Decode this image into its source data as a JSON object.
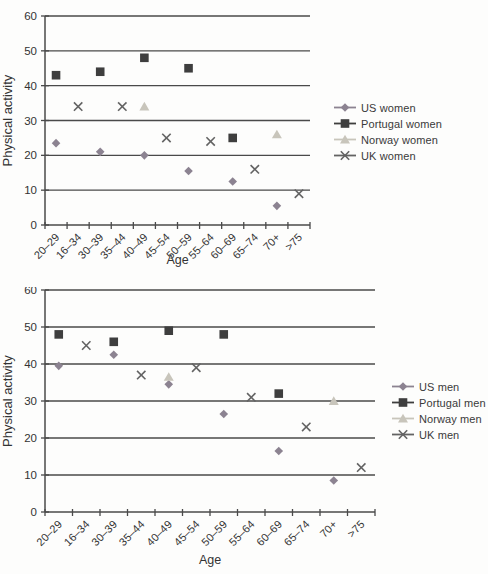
{
  "figure": {
    "background": "#fdfdfc"
  },
  "colors": {
    "us": "#8c8391",
    "portugal": "#3e3e3e",
    "norway": "#c8c5bb",
    "uk": "#636363",
    "grid": "#4a4a4a",
    "text": "#333333"
  },
  "chart_data": [
    {
      "type": "scatter",
      "title": "",
      "xlabel": "Age",
      "ylabel": "Physical activity",
      "ylim": [
        0,
        60
      ],
      "yticks": [
        0,
        10,
        20,
        30,
        40,
        50,
        60
      ],
      "grid": true,
      "legend_position": "right",
      "categories": [
        "20–29",
        "16–34",
        "30–39",
        "35–44",
        "40–49",
        "45–54",
        "50–59",
        "55–64",
        "60–69",
        "65–74",
        "70+",
        ">75"
      ],
      "series": [
        {
          "name": "US women",
          "marker": "diamond",
          "color": "#8c8391",
          "values": [
            23.5,
            null,
            21,
            null,
            20,
            null,
            15.5,
            null,
            12.5,
            null,
            5.5,
            null
          ]
        },
        {
          "name": "Portugal women",
          "marker": "square",
          "color": "#3e3e3e",
          "values": [
            43,
            null,
            44,
            null,
            48,
            null,
            45,
            null,
            25,
            null,
            null,
            null
          ]
        },
        {
          "name": "Norway women",
          "marker": "triangle",
          "color": "#c8c5bb",
          "values": [
            null,
            null,
            null,
            null,
            34,
            null,
            null,
            null,
            null,
            null,
            26,
            null
          ]
        },
        {
          "name": "UK women",
          "marker": "x",
          "color": "#636363",
          "values": [
            null,
            34,
            null,
            34,
            null,
            25,
            null,
            24,
            null,
            16,
            null,
            9
          ]
        }
      ]
    },
    {
      "type": "scatter",
      "title": "",
      "xlabel": "Age",
      "ylabel": "Physical activity",
      "ylim": [
        0,
        60
      ],
      "yticks": [
        0,
        10,
        20,
        30,
        40,
        50,
        60
      ],
      "grid": true,
      "legend_position": "right",
      "categories": [
        "20–29",
        "16–34",
        "30–39",
        "35–44",
        "40–49",
        "45–54",
        "50–59",
        "55–64",
        "60–69",
        "65–74",
        "70+",
        ">75"
      ],
      "series": [
        {
          "name": "US men",
          "marker": "diamond",
          "color": "#8c8391",
          "values": [
            39.5,
            null,
            42.5,
            null,
            34.5,
            null,
            26.5,
            null,
            16.5,
            null,
            8.5,
            null
          ]
        },
        {
          "name": "Portugal men",
          "marker": "square",
          "color": "#3e3e3e",
          "values": [
            48,
            null,
            46,
            null,
            49,
            null,
            48,
            null,
            32,
            null,
            null,
            null
          ]
        },
        {
          "name": "Norway men",
          "marker": "triangle",
          "color": "#c8c5bb",
          "values": [
            null,
            null,
            null,
            null,
            36.5,
            null,
            null,
            null,
            null,
            null,
            30,
            null
          ]
        },
        {
          "name": "UK men",
          "marker": "x",
          "color": "#636363",
          "values": [
            null,
            45,
            null,
            37,
            null,
            39,
            null,
            31,
            null,
            23,
            null,
            12
          ]
        }
      ]
    }
  ]
}
